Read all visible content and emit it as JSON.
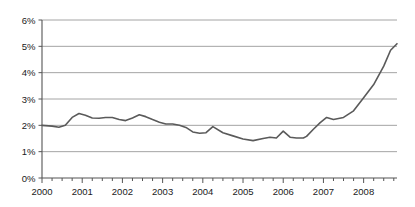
{
  "chart_data": {
    "type": "line",
    "title": "",
    "subtitle": "",
    "xlabel": "",
    "ylabel": "",
    "ylim": [
      0,
      6
    ],
    "xlim": [
      2000.0,
      2008.83
    ],
    "grid": true,
    "legend": null,
    "y_tick_labels": [
      "0%",
      "1%",
      "2%",
      "3%",
      "4%",
      "5%",
      "6%"
    ],
    "y_tick_values": [
      0,
      1,
      2,
      3,
      4,
      5,
      6
    ],
    "x_tick_labels": [
      "2000",
      "2001",
      "2002",
      "2003",
      "2004",
      "2005",
      "2006",
      "2007",
      "2008"
    ],
    "x_tick_values": [
      2000,
      2001,
      2002,
      2003,
      2004,
      2005,
      2006,
      2007,
      2008
    ],
    "x_minor_interval": 0.25,
    "series": [
      {
        "name": "rate",
        "color": "#5a5a5a",
        "x": [
          2000.0,
          2000.25,
          2000.42,
          2000.58,
          2000.75,
          2000.92,
          2001.08,
          2001.25,
          2001.42,
          2001.58,
          2001.75,
          2001.92,
          2002.08,
          2002.25,
          2002.42,
          2002.58,
          2002.75,
          2002.92,
          2003.08,
          2003.25,
          2003.42,
          2003.58,
          2003.75,
          2003.92,
          2004.08,
          2004.25,
          2004.5,
          2004.75,
          2005.0,
          2005.25,
          2005.5,
          2005.67,
          2005.83,
          2006.0,
          2006.17,
          2006.33,
          2006.5,
          2006.58,
          2006.75,
          2006.92,
          2007.08,
          2007.25,
          2007.5,
          2007.75,
          2008.0,
          2008.25,
          2008.5,
          2008.67,
          2008.83
        ],
        "values": [
          2.0,
          1.97,
          1.93,
          2.0,
          2.3,
          2.45,
          2.38,
          2.28,
          2.27,
          2.3,
          2.3,
          2.22,
          2.18,
          2.28,
          2.4,
          2.33,
          2.22,
          2.12,
          2.05,
          2.05,
          2.0,
          1.92,
          1.75,
          1.7,
          1.72,
          1.95,
          1.72,
          1.6,
          1.48,
          1.42,
          1.5,
          1.55,
          1.52,
          1.78,
          1.55,
          1.52,
          1.52,
          1.58,
          1.85,
          2.1,
          2.3,
          2.22,
          2.3,
          2.55,
          3.05,
          3.55,
          4.25,
          4.85,
          5.1
        ]
      }
    ],
    "annotations": []
  },
  "geometry": {
    "plot_left": 42,
    "plot_right": 397,
    "plot_top": 20,
    "plot_bottom": 178,
    "axis_color": "#555555",
    "grid_color": "#9a9a9a",
    "line_color": "#5a5a5a",
    "line_width": 1.6,
    "background": "#ffffff"
  }
}
